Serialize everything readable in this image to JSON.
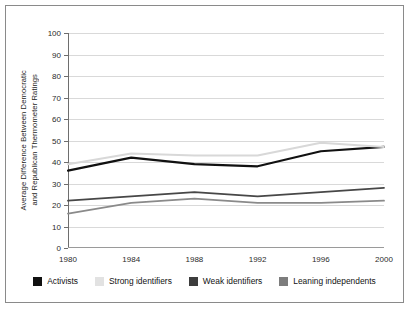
{
  "chart_data": {
    "type": "line",
    "title": "",
    "xlabel": "",
    "ylabel": "Average Difference Between Democratic\nand Republican Thermometer Ratings",
    "categories": [
      "1980",
      "1984",
      "1988",
      "1992",
      "1996",
      "2000"
    ],
    "x": [
      1980,
      1984,
      1988,
      1992,
      1996,
      2000
    ],
    "ylim": [
      0,
      100
    ],
    "ytick_labels": [
      "0",
      "10",
      "20",
      "30",
      "40",
      "50",
      "60",
      "70",
      "80",
      "90",
      "100"
    ],
    "yticks": [
      0,
      10,
      20,
      30,
      40,
      50,
      60,
      70,
      80,
      90,
      100
    ],
    "grid": "horizontal",
    "legend_position": "bottom",
    "series": [
      {
        "name": "Activists",
        "color": "#111111",
        "width": 2.2,
        "values": [
          36,
          42,
          39,
          38,
          45,
          47
        ]
      },
      {
        "name": "Strong identifiers",
        "color": "#d8d8d8",
        "width": 2.0,
        "values": [
          39,
          44,
          43,
          43,
          49,
          47
        ]
      },
      {
        "name": "Weak identifiers",
        "color": "#474747",
        "width": 1.8,
        "values": [
          22,
          24,
          26,
          24,
          26,
          28
        ]
      },
      {
        "name": "Leaning independents",
        "color": "#8a8a8a",
        "width": 1.8,
        "values": [
          16,
          21,
          23,
          21,
          21,
          22
        ]
      }
    ]
  },
  "legend": {
    "items": [
      {
        "label": "Activists",
        "color": "#111111"
      },
      {
        "label": "Strong identifiers",
        "color": "#e2e2e2"
      },
      {
        "label": "Weak identifiers",
        "color": "#3d3d3d"
      },
      {
        "label": "Leaning independents",
        "color": "#7d7d7d"
      }
    ]
  }
}
